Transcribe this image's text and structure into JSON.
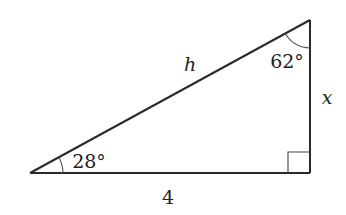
{
  "diagram": {
    "type": "right-triangle",
    "colors": {
      "stroke": "#2a2a2a",
      "arc": "#555555",
      "background": "#ffffff",
      "text": "#222222"
    },
    "vertices": {
      "bottom_left": [
        30,
        173
      ],
      "right_angle": [
        310,
        173
      ],
      "top": [
        310,
        20
      ]
    },
    "labels": {
      "hypotenuse": "h",
      "vertical_side": "x",
      "base": "4",
      "angle_bottom_left": "28°",
      "angle_top": "62°"
    },
    "right_angle_marker": true
  }
}
